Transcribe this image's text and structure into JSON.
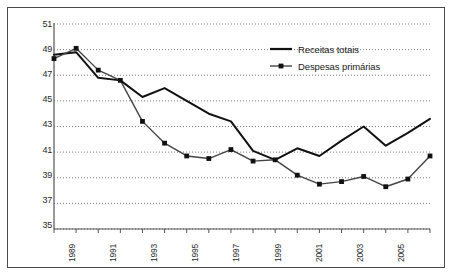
{
  "chart_data": {
    "type": "line",
    "title": "",
    "subtitle": "",
    "xlabel": "",
    "ylabel": "",
    "xlim": [
      1989,
      2006
    ],
    "ylim": [
      35,
      51
    ],
    "ytick_labels": [
      "51",
      "49",
      "47",
      "45",
      "43",
      "41",
      "39",
      "37",
      "35"
    ],
    "ytick_values": [
      51,
      49,
      47,
      45,
      43,
      41,
      39,
      37,
      35
    ],
    "xtick_labels": [
      "1989",
      "1991",
      "1993",
      "1995",
      "1997",
      "1999",
      "2001",
      "2003",
      "2005"
    ],
    "xtick_values": [
      1989,
      1991,
      1993,
      1995,
      1997,
      1999,
      2001,
      2003,
      2005
    ],
    "x": [
      1989,
      1990,
      1991,
      1992,
      1993,
      1994,
      1995,
      1996,
      1997,
      1998,
      1999,
      2000,
      2001,
      2002,
      2003,
      2004,
      2005,
      2006
    ],
    "grid": true,
    "grid_style": "dotted-horizontal",
    "legend_position": "top-right",
    "series": [
      {
        "name": "Receitas totais",
        "marker": "none",
        "color": "#111111",
        "values": [
          48.6,
          48.8,
          46.8,
          46.6,
          45.3,
          46.0,
          45.0,
          44.0,
          43.4,
          41.1,
          40.4,
          41.3,
          40.7,
          41.9,
          43.0,
          41.5,
          42.5,
          43.6
        ]
      },
      {
        "name": "Despesas primárias",
        "marker": "square",
        "color": "#444444",
        "values": [
          48.3,
          49.1,
          47.4,
          46.6,
          43.4,
          41.7,
          40.7,
          40.5,
          41.2,
          40.3,
          40.4,
          39.2,
          38.5,
          38.7,
          39.1,
          38.3,
          38.9,
          40.7
        ]
      }
    ]
  },
  "legend": {
    "items": [
      {
        "label": "Receitas totais",
        "marker": "line"
      },
      {
        "label": "Despesas primárias",
        "marker": "line-square"
      }
    ]
  }
}
